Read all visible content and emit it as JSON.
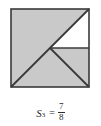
{
  "figure": {
    "shape": "square",
    "fill_color": "#c9c9c9",
    "line_color": "#3a3a3a",
    "background_color": "#ffffff",
    "shaded_fraction_text": "7/8",
    "unshaded_fraction_text": "1/8",
    "square": {
      "x": 11,
      "y": 9,
      "size": 78
    },
    "regions": [
      {
        "name": "lower-left-half-triangle",
        "shaded": true,
        "fraction": "1/2"
      },
      {
        "name": "lower-right-quarter-triangle",
        "shaded": true,
        "fraction": "1/4"
      },
      {
        "name": "upper-right-lower-eighth-triangle",
        "shaded": true,
        "fraction": "1/8"
      },
      {
        "name": "upper-right-upper-eighth-triangle",
        "shaded": false,
        "fraction": "1/8"
      }
    ]
  },
  "caption": {
    "symbol": "S",
    "subscript": "3",
    "equals": "=",
    "numerator": "7",
    "denominator": "8",
    "full_text": "S3 = 7/8"
  },
  "chart_data": {
    "type": "diagram",
    "categories": [
      "1/2",
      "1/4",
      "1/8",
      "remaining 1/8"
    ],
    "values": [
      0.5,
      0.25,
      0.125,
      0.125
    ],
    "shaded_total": 0.875,
    "unshaded_total": 0.125
  }
}
